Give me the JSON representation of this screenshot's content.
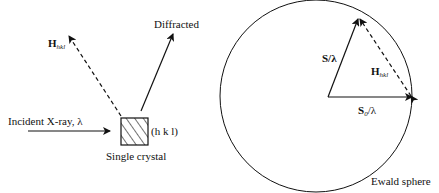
{
  "left_panel": {
    "incident_label": "Incident X-ray, λ",
    "diffracted_label": "Diffracted",
    "reciprocal_vector": {
      "main": "H",
      "subscript": "hkl"
    },
    "crystal_plane_label": "(h k l)",
    "crystal_label": "Single crystal"
  },
  "right_panel": {
    "scattered_vector_label": "S/λ",
    "incident_vector": {
      "main": "S",
      "subscript": "0",
      "suffix": "/λ"
    },
    "reciprocal_vector": {
      "main": "H",
      "subscript": "hkl"
    },
    "sphere_label": "Ewald sphere"
  },
  "colors": {
    "stroke": "#111111",
    "background": "#ffffff"
  }
}
